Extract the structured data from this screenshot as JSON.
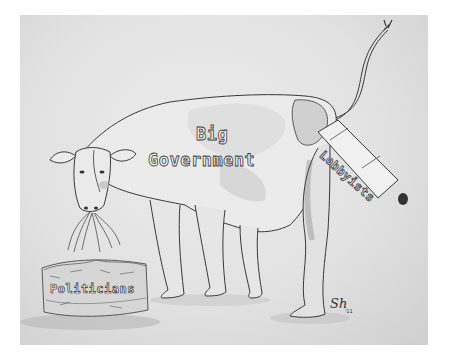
{
  "cartoon": {
    "type": "pencil sketch editorial cartoon",
    "labels": {
      "body_line1": "Big",
      "body_line2": "Government",
      "udder_tube": "Lobbyists",
      "hay_bale": "Politicians"
    },
    "signature": "Sh",
    "signature_year": "'11",
    "colors": {
      "background": "#ffffff",
      "paper": "#e4e4e4",
      "pencil": "#3a3a3a"
    }
  }
}
